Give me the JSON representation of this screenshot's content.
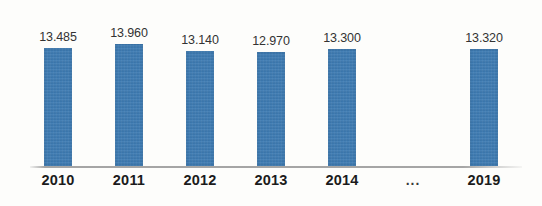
{
  "chart_data": {
    "type": "bar",
    "title": "",
    "subtitle": "",
    "xlabel": "",
    "ylabel": "",
    "categories": [
      "2010",
      "2011",
      "2012",
      "2013",
      "2014",
      "...",
      "2019"
    ],
    "labels": [
      "13.485",
      "13.960",
      "13.140",
      "12.970",
      "13.300",
      "",
      "13.320"
    ],
    "values": [
      13.485,
      13.96,
      13.14,
      12.97,
      13.3,
      null,
      13.32
    ],
    "bar_heights_px": [
      118,
      122,
      115,
      114,
      117,
      0,
      117
    ],
    "ylim": [
      0,
      14.5
    ],
    "grid": false,
    "legend": null,
    "colors": {
      "bar": "#3a7ab4",
      "value_label": "#333333",
      "category_label": "#1b1b1b",
      "axis_line": "#969696",
      "background": "#fdfdfb"
    }
  }
}
